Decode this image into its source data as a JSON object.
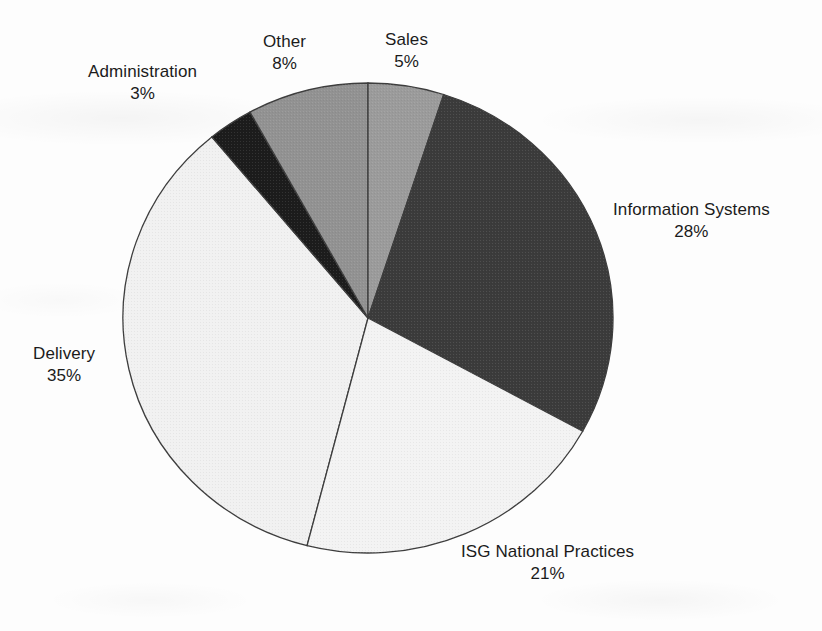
{
  "chart_data": {
    "type": "pie",
    "title": "",
    "subtitle": "",
    "xlabel": "",
    "ylabel": "",
    "legend_position": "none",
    "grid": false,
    "start_angle_deg": 0,
    "direction": "clockwise",
    "units": "percent",
    "categories": [
      "Sales",
      "Information Systems",
      "ISG National Practices",
      "Delivery",
      "Administration",
      "Other"
    ],
    "values": [
      5,
      28,
      21,
      35,
      3,
      8
    ],
    "slices": [
      {
        "label": "Sales",
        "value": 5,
        "value_text": "5%",
        "color": "#9b9b9b",
        "start_deg": 0,
        "end_deg": 18,
        "label_position": "top-center-right",
        "label_align": "center"
      },
      {
        "label": "Information Systems",
        "value": 28,
        "value_text": "28%",
        "color": "#3b3b3b",
        "start_deg": 18,
        "end_deg": 118.8,
        "label_position": "right",
        "label_align": "center"
      },
      {
        "label": "ISG National Practices",
        "value": 21,
        "value_text": "21%",
        "color": "#f3f3f3",
        "start_deg": 118.8,
        "end_deg": 194.4,
        "label_position": "bottom-right",
        "label_align": "center"
      },
      {
        "label": "Delivery",
        "value": 35,
        "value_text": "35%",
        "color": "#f1f1f1",
        "start_deg": 194.4,
        "end_deg": 320.4,
        "label_position": "left",
        "label_align": "center"
      },
      {
        "label": "Administration",
        "value": 3,
        "value_text": "3%",
        "color": "#1c1c1c",
        "start_deg": 320.4,
        "end_deg": 331.2,
        "label_position": "top-left",
        "label_align": "center"
      },
      {
        "label": "Other",
        "value": 8,
        "value_text": "8%",
        "color": "#929292",
        "start_deg": 331.2,
        "end_deg": 360,
        "label_position": "top-center-left",
        "label_align": "center"
      }
    ],
    "total": 100,
    "stroke_color": "#3d3d3d",
    "background_color": "#fdfdfd"
  },
  "geometry": {
    "center_x": 368,
    "center_y": 318,
    "radius_x": 245,
    "radius_y": 235
  }
}
